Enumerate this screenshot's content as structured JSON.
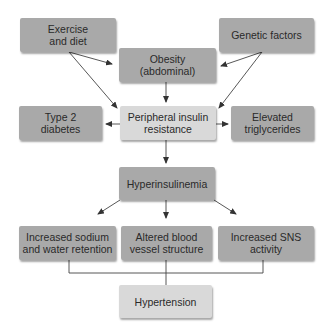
{
  "diagram": {
    "type": "flowchart",
    "colors": {
      "dark_box": "#a9a9a9",
      "light_box": "#d9d9d9",
      "line": "#444444"
    },
    "nodes": {
      "exercise": {
        "label": "Exercise and diet",
        "line1": "Exercise",
        "line2": "and diet",
        "style": "dark"
      },
      "genetic": {
        "label": "Genetic factors",
        "line1": "Genetic factors",
        "line2": "",
        "style": "dark"
      },
      "obesity": {
        "label": "Obesity (abdominal)",
        "line1": "Obesity",
        "line2": "(abdominal)",
        "style": "dark"
      },
      "diabetes": {
        "label": "Type 2 diabetes",
        "line1": "Type 2",
        "line2": "diabetes",
        "style": "dark"
      },
      "insulin_resistance": {
        "label": "Peripheral insulin resistance",
        "line1": "Peripheral insulin",
        "line2": "resistance",
        "style": "light"
      },
      "triglycerides": {
        "label": "Elevated triglycerides",
        "line1": "Elevated",
        "line2": "triglycerides",
        "style": "dark"
      },
      "hyperinsulinemia": {
        "label": "Hyperinsulinemia",
        "line1": "Hyperinsulinemia",
        "line2": "",
        "style": "dark"
      },
      "sodium": {
        "label": "Increased sodium and water retention",
        "line1": "Increased sodium",
        "line2": "and water retention",
        "style": "dark"
      },
      "vessel": {
        "label": "Altered blood vessel structure",
        "line1": "Altered blood",
        "line2": "vessel structure",
        "style": "dark"
      },
      "sns": {
        "label": "Increased SNS activity",
        "line1": "Increased SNS",
        "line2": "activity",
        "style": "dark"
      },
      "hypertension": {
        "label": "Hypertension",
        "line1": "Hypertension",
        "line2": "",
        "style": "light"
      }
    },
    "edges": [
      {
        "from": "exercise",
        "to": "obesity",
        "type": "arrow"
      },
      {
        "from": "exercise",
        "to": "insulin_resistance",
        "type": "arrow"
      },
      {
        "from": "genetic",
        "to": "obesity",
        "type": "arrow"
      },
      {
        "from": "genetic",
        "to": "insulin_resistance",
        "type": "arrow"
      },
      {
        "from": "obesity",
        "to": "insulin_resistance",
        "type": "arrow"
      },
      {
        "from": "insulin_resistance",
        "to": "diabetes",
        "type": "arrow"
      },
      {
        "from": "insulin_resistance",
        "to": "triglycerides",
        "type": "arrow"
      },
      {
        "from": "insulin_resistance",
        "to": "hyperinsulinemia",
        "type": "arrow"
      },
      {
        "from": "hyperinsulinemia",
        "to": "sodium",
        "type": "arrow"
      },
      {
        "from": "hyperinsulinemia",
        "to": "vessel",
        "type": "arrow"
      },
      {
        "from": "hyperinsulinemia",
        "to": "sns",
        "type": "arrow"
      },
      {
        "from": "sodium",
        "to": "hypertension",
        "type": "bracket-line"
      },
      {
        "from": "vessel",
        "to": "hypertension",
        "type": "bracket-line"
      },
      {
        "from": "sns",
        "to": "hypertension",
        "type": "bracket-line"
      }
    ]
  }
}
